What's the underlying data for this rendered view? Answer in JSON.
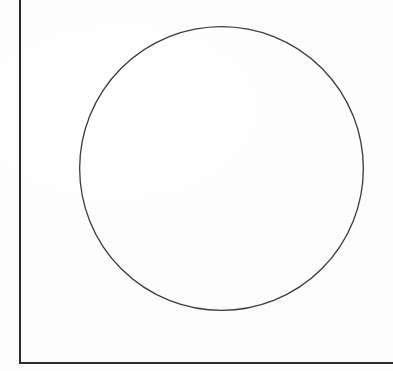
{
  "document": {
    "kind": "scanned-page",
    "background_color": "#fefefe",
    "width_px": 393,
    "height_px": 371,
    "alt_text": ""
  },
  "frame": {
    "style": "open-L-frame",
    "stroke_color": "#2b2b2d",
    "stroke_width_px": 2,
    "left_border": {
      "x_px": 19,
      "y_top_px": 0,
      "y_bottom_px": 364
    },
    "bottom_border": {
      "y_px": 362,
      "x_left_px": 19,
      "x_right_px": 393
    },
    "top_border_visible": false,
    "right_border_visible": false
  },
  "figure": {
    "shape": "circle",
    "label": "",
    "stroke_color": "#3a3a3c",
    "stroke_width_px": 1.3,
    "fill": "none",
    "center_x_px": 221.5,
    "center_y_px": 168.5,
    "radius_px": 142.5,
    "bounds": {
      "left_px": 79,
      "top_px": 26,
      "right_px": 364,
      "bottom_px": 311
    }
  },
  "ghost_text": {
    "description": "faint bleed-through from the reverse side of the sheet; illegible",
    "color": "#f1f1f2",
    "lines": [
      {
        "text": "····· ······· ··· ····",
        "x_px": 292,
        "y_px": 68,
        "size_px": 7.5
      },
      {
        "text": "········ ····",
        "x_px": 305,
        "y_px": 82,
        "size_px": 7.5
      },
      {
        "text": "···· ··· ··········",
        "x_px": 246,
        "y_px": 154,
        "size_px": 7.5
      },
      {
        "text": "··· ···· ···········",
        "x_px": 258,
        "y_px": 168,
        "size_px": 7.5
      },
      {
        "text": "······ ··· ····· ···",
        "x_px": 70,
        "y_px": 200,
        "size_px": 7.5
      },
      {
        "text": "···· ······· ··",
        "x_px": 40,
        "y_px": 214,
        "size_px": 7.5
      },
      {
        "text": "··· ······· ····",
        "x_px": 296,
        "y_px": 234,
        "size_px": 7.5
      },
      {
        "text": "····· ········· ··",
        "x_px": 288,
        "y_px": 248,
        "size_px": 7.5
      },
      {
        "text": "····· ···· ········ ····· ···· ······",
        "x_px": 68,
        "y_px": 286,
        "size_px": 7.5
      },
      {
        "text": "······ ······· ··· ········· ·····",
        "x_px": 114,
        "y_px": 336,
        "size_px": 7.5
      },
      {
        "text": "····· ···· ······ ··· ······",
        "x_px": 200,
        "y_px": 350,
        "size_px": 7.5
      }
    ]
  }
}
